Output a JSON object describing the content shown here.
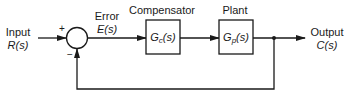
{
  "diagram": {
    "type": "closed-loop feedback control block diagram",
    "input": {
      "label": "Input",
      "signal": "R(s)"
    },
    "summing_junction": {
      "plus_sign": "+",
      "minus_sign": "−"
    },
    "error": {
      "label": "Error",
      "signal": "E(s)"
    },
    "blocks": [
      {
        "title": "Compensator",
        "transfer_function": "G",
        "subscript": "c",
        "arg": "(s)"
      },
      {
        "title": "Plant",
        "transfer_function": "G",
        "subscript": "p",
        "arg": "(s)"
      }
    ],
    "output": {
      "label": "Output",
      "signal": "C(s)"
    },
    "feedback": "unity negative feedback"
  }
}
